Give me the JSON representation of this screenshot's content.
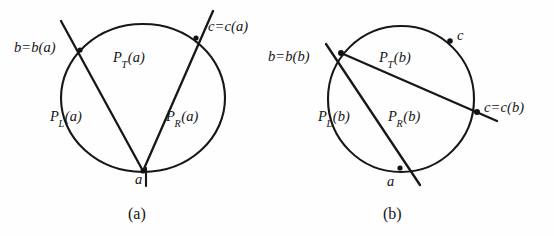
{
  "figure": {
    "stroke_color": "#171717",
    "background_color": "#fefefe"
  },
  "panels": [
    {
      "id": "a",
      "caption": "(a)",
      "shape": "ellipse",
      "labels": {
        "b_point": "b=b(a)",
        "c_point": "c=c(a)",
        "a_point": "a",
        "region_top": "P_T(a)",
        "region_top_base": "P",
        "region_top_sub": "T",
        "region_top_arg": "(a)",
        "region_left_base": "P",
        "region_left_sub": "L",
        "region_left_arg": "(a)",
        "region_right_base": "P",
        "region_right_sub": "R",
        "region_right_arg": "(a)"
      }
    },
    {
      "id": "b",
      "caption": "(b)",
      "shape": "circle",
      "labels": {
        "b_point": "b=b(b)",
        "c_marker": "c",
        "c_point": "c=c(b)",
        "a_point": "a",
        "region_top_base": "P",
        "region_top_sub": "T",
        "region_top_arg": "(b)",
        "region_left_base": "P",
        "region_left_sub": "L",
        "region_left_arg": "(b)",
        "region_right_base": "P",
        "region_right_sub": "R",
        "region_right_arg": "(b)"
      }
    }
  ],
  "geometry": {
    "panel_a": {
      "ellipse_center": [
        143,
        98
      ],
      "ellipse_rx": 82,
      "ellipse_ry": 74,
      "vertex_a": [
        143,
        171
      ],
      "vertex_b": [
        80,
        50
      ],
      "vertex_c": [
        196,
        38
      ]
    },
    "panel_b": {
      "circle_center": [
        401,
        99
      ],
      "circle_r": 73,
      "vertex_a": [
        400,
        168
      ],
      "vertex_b": [
        341,
        53
      ],
      "vertex_c": [
        477,
        112
      ],
      "marker_c": [
        449,
        41
      ]
    }
  }
}
